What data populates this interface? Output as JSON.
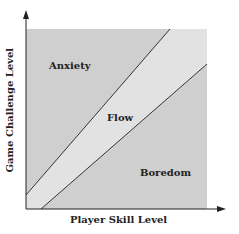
{
  "diagram": {
    "x_axis_label": "Player Skill Level",
    "y_axis_label": "Game Challenge Level",
    "regions": [
      {
        "name": "Anxiety",
        "color": "#cfcfcf"
      },
      {
        "name": "Flow",
        "color": "#e2e2e2"
      },
      {
        "name": "Boredom",
        "color": "#cfcfcf"
      }
    ],
    "line_color": "#333333",
    "axis_color": "#222222"
  }
}
